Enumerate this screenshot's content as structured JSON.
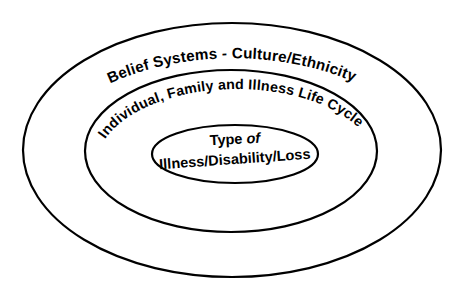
{
  "diagram": {
    "background_color": "#ffffff",
    "stroke_color": "#000000",
    "text_color": "#000000",
    "rings": [
      {
        "id": "outer",
        "name": "belief-systems-ring",
        "label": "Belief Systems - Culture/Ethnicity",
        "cx": 232,
        "cy": 150,
        "rx": 209,
        "ry": 127,
        "stroke_width": 2.2
      },
      {
        "id": "middle",
        "name": "life-cycle-ring",
        "label": "Individual, Family and Illness Life Cycle",
        "cx": 231,
        "cy": 151,
        "rx": 146,
        "ry": 81,
        "stroke_width": 2.2
      },
      {
        "id": "inner",
        "name": "type-of-illness-ring",
        "label_line_1": "Type",
        "label_line_1_emphasis": "of",
        "label_line_2": "Illness/Disability/Loss",
        "cx": 235,
        "cy": 154,
        "rx": 83,
        "ry": 29,
        "stroke_width": 2.2
      }
    ]
  }
}
